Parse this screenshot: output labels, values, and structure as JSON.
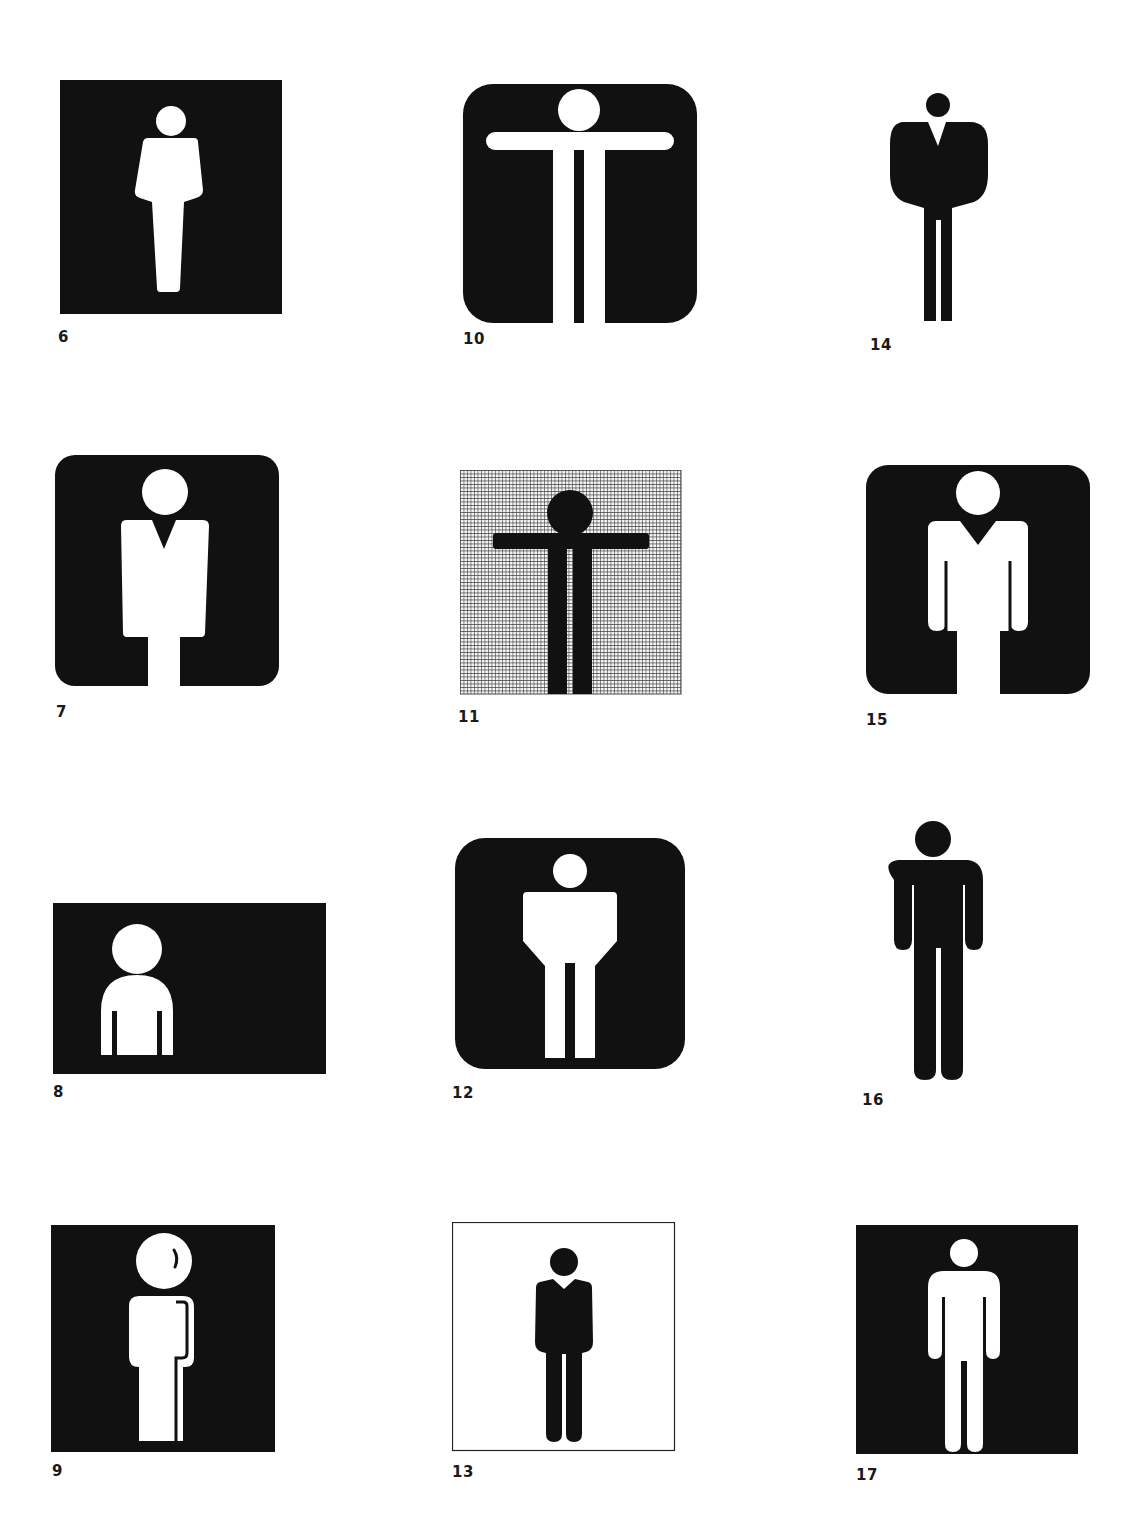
{
  "page": {
    "background": "#ffffff",
    "ink": "#111111"
  },
  "pictograms": [
    {
      "number": "6",
      "style": "white figure on black square, tapered torso"
    },
    {
      "number": "7",
      "style": "white figure with V-collar on rounded black square"
    },
    {
      "number": "8",
      "style": "white bust on black rectangle"
    },
    {
      "number": "9",
      "style": "white figure with outlined arm on black square"
    },
    {
      "number": "10",
      "style": "white T-shaped figure on rounded black square"
    },
    {
      "number": "11",
      "style": "black T-figure on fine grid"
    },
    {
      "number": "12",
      "style": "white figure on rounded black square"
    },
    {
      "number": "13",
      "style": "black figure inside thin outlined square"
    },
    {
      "number": "14",
      "style": "black figure with broad jacket, no background"
    },
    {
      "number": "15",
      "style": "white figure with V-collar and arms on rounded black square"
    },
    {
      "number": "16",
      "style": "black standing figure, no background"
    },
    {
      "number": "17",
      "style": "white standing figure on black square"
    }
  ]
}
